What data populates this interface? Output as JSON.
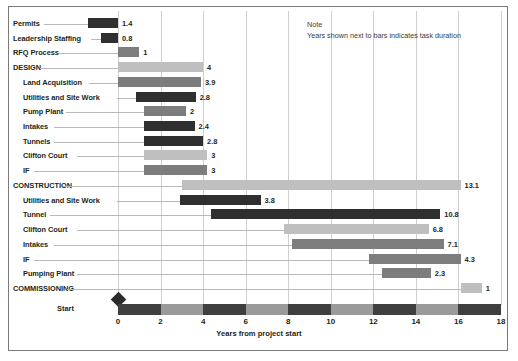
{
  "note": {
    "title": "Note",
    "text": "Years shown next to bars indicates task duration"
  },
  "axis": {
    "title": "Years from project start",
    "start_label": "Start",
    "ticks": [
      "0",
      "2",
      "4",
      "6",
      "8",
      "10",
      "12",
      "14",
      "16",
      "18"
    ]
  },
  "chart_data": {
    "type": "bar",
    "subtype": "gantt",
    "title": "",
    "xlabel": "Years from project start",
    "ylabel": "",
    "xlim": [
      0,
      18
    ],
    "xticks": [
      0,
      2,
      4,
      6,
      8,
      10,
      12,
      14,
      16,
      18
    ],
    "grid": "vertical",
    "legend": "none",
    "annotations": [
      "Note",
      "Years shown next to bars indicates task duration"
    ],
    "value_label_note": "Years shown next to bars indicates task duration",
    "categories": [
      "Permits",
      "Leadership Staffing",
      "RFQ Process",
      "DESIGN",
      "Land Acquisition",
      "Utilities and Site Work",
      "Pump Plant",
      "Intakes",
      "Tunnels",
      "Clifton Court",
      "IF",
      "CONSTRUCTION",
      "Utilities and Site Work",
      "Tunnel",
      "Clifton Court",
      "Intakes",
      "IF",
      "Pumping Plant",
      "COMMISSIONING"
    ],
    "values": [
      1.4,
      0.8,
      1,
      4,
      3.9,
      2.8,
      2,
      2.4,
      2.8,
      3,
      3,
      13.1,
      3.8,
      10.8,
      6.8,
      7.1,
      4.3,
      2.3,
      1
    ],
    "tasks": [
      {
        "label": "Permits",
        "indent": 0,
        "start": -1.4,
        "duration": 1.4,
        "value": "1.4",
        "shade": "dark"
      },
      {
        "label": "Leadership Staffing",
        "indent": 0,
        "start": -0.8,
        "duration": 0.8,
        "value": "0.8",
        "shade": "dark"
      },
      {
        "label": "RFQ Process",
        "indent": 0,
        "start": 0.0,
        "duration": 1,
        "value": "1",
        "shade": "mid"
      },
      {
        "label": "DESIGN",
        "indent": 0,
        "start": 0.0,
        "duration": 4,
        "value": "4",
        "shade": "light"
      },
      {
        "label": "Land Acquisition",
        "indent": 1,
        "start": 0.0,
        "duration": 3.9,
        "value": "3.9",
        "shade": "mid"
      },
      {
        "label": "Utilities and Site Work",
        "indent": 1,
        "start": 0.85,
        "duration": 2.8,
        "value": "2.8",
        "shade": "dark"
      },
      {
        "label": "Pump Plant",
        "indent": 1,
        "start": 1.2,
        "duration": 2,
        "value": "2",
        "shade": "mid"
      },
      {
        "label": "Intakes",
        "indent": 1,
        "start": 1.2,
        "duration": 2.4,
        "value": "2.4",
        "shade": "dark"
      },
      {
        "label": "Tunnels",
        "indent": 1,
        "start": 1.2,
        "duration": 2.8,
        "value": "2.8",
        "shade": "dark"
      },
      {
        "label": "Clifton Court",
        "indent": 1,
        "start": 1.2,
        "duration": 3,
        "value": "3",
        "shade": "light"
      },
      {
        "label": "IF",
        "indent": 1,
        "start": 1.2,
        "duration": 3,
        "value": "3",
        "shade": "mid"
      },
      {
        "label": "CONSTRUCTION",
        "indent": 0,
        "start": 3.0,
        "duration": 13.1,
        "value": "13.1",
        "shade": "light"
      },
      {
        "label": "Utilities and Site Work",
        "indent": 1,
        "start": 2.9,
        "duration": 3.8,
        "value": "3.8",
        "shade": "dark"
      },
      {
        "label": "Tunnel",
        "indent": 1,
        "start": 4.35,
        "duration": 10.8,
        "value": "10.8",
        "shade": "dark"
      },
      {
        "label": "Clifton Court",
        "indent": 1,
        "start": 7.8,
        "duration": 6.8,
        "value": "6.8",
        "shade": "light"
      },
      {
        "label": "Intakes",
        "indent": 1,
        "start": 8.2,
        "duration": 7.1,
        "value": "7.1",
        "shade": "mid"
      },
      {
        "label": "IF",
        "indent": 1,
        "start": 11.8,
        "duration": 4.3,
        "value": "4.3",
        "shade": "mid"
      },
      {
        "label": "Pumping Plant",
        "indent": 1,
        "start": 12.4,
        "duration": 2.3,
        "value": "2.3",
        "shade": "mid"
      },
      {
        "label": "COMMISSIONING",
        "indent": 0,
        "start": 16.1,
        "duration": 1,
        "value": "1",
        "shade": "light"
      }
    ]
  },
  "colors": {
    "dark": "#2f2f2f",
    "mid": "#7d7d7d",
    "light": "#bfbfbf",
    "axis_band_light": "#9a9a9a",
    "axis_band_dark": "#3f3f3f",
    "gridline": "#cfcfcf",
    "leader": "#b9b9b9",
    "text": "#231f20"
  }
}
